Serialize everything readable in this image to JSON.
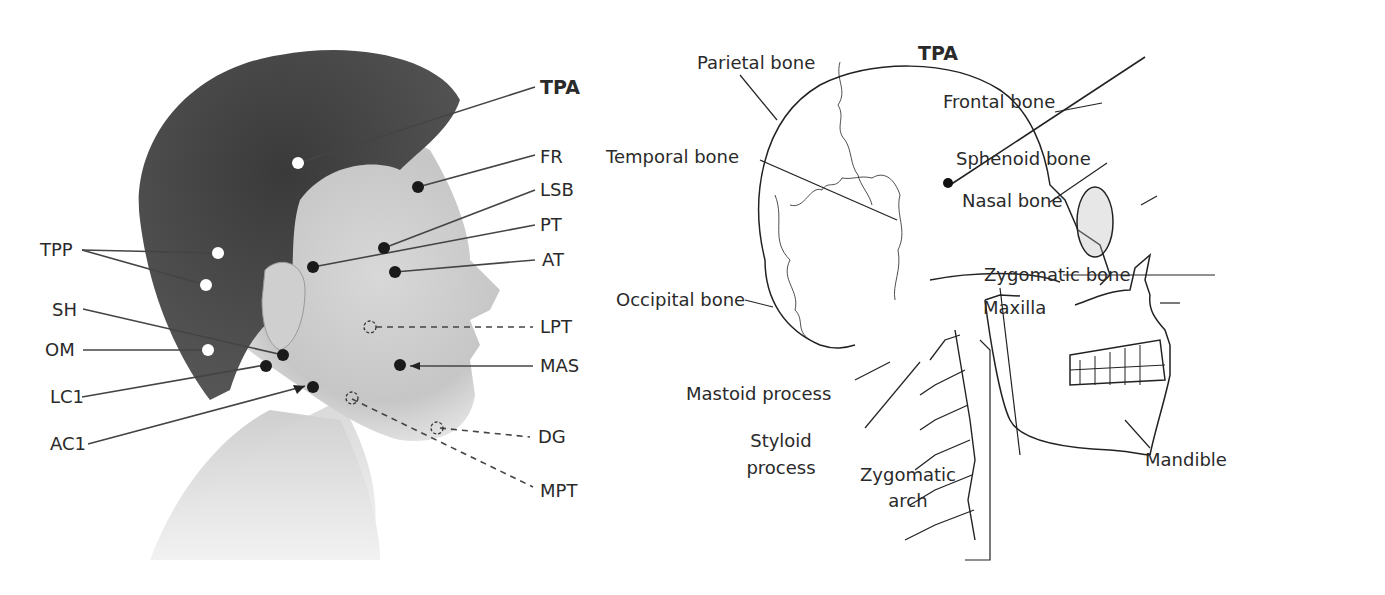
{
  "left_figure": {
    "description": "Head profile photograph with muscle trigger point markers",
    "labels": {
      "tpa": "TPA",
      "fr": "FR",
      "lsb": "LSB",
      "pt": "PT",
      "at": "AT",
      "tpp": "TPP",
      "sh": "SH",
      "om": "OM",
      "lci": "LC1",
      "aci": "AC1",
      "lpt": "LPT",
      "mas": "MAS",
      "dg": "DG",
      "mpt": "MPT"
    },
    "marker_colors": {
      "filled": "#1a1a1a",
      "open": "#ffffff",
      "hidden": "dashed"
    }
  },
  "right_figure": {
    "description": "Lateral skull and cervical spine illustration",
    "labels": {
      "parietal": "Parietal bone",
      "tpa": "TPA",
      "frontal": "Frontal bone",
      "temporal": "Temporal bone",
      "sphenoid": "Sphenoid bone",
      "nasal": "Nasal bone",
      "zygomatic_bone": "Zygomatic bone",
      "occipital": "Occipital bone",
      "maxilla": "Maxilla",
      "mastoid": "Mastoid process",
      "styloid_1": "Styloid",
      "styloid_2": "process",
      "zygomatic_arch_1": "Zygomatic",
      "zygomatic_arch_2": "arch",
      "mandible": "Mandible"
    }
  }
}
